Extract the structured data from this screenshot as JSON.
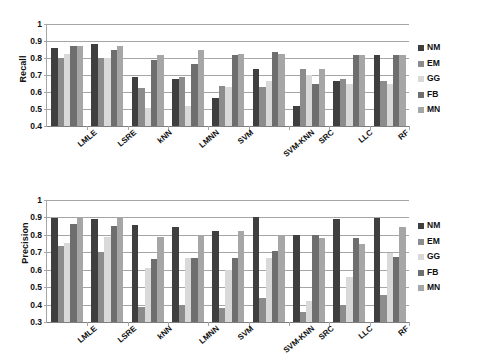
{
  "chart_data": [
    {
      "type": "bar",
      "title": "",
      "xlabel": "",
      "ylabel": "Recall",
      "ylim": [
        0.4,
        1.0
      ],
      "yticks": [
        "0.4",
        "0.5",
        "0.6",
        "0.7",
        "0.8",
        "0.9",
        "1"
      ],
      "grid": true,
      "legend_position": "right",
      "categories": [
        "LMLE",
        "LSRE",
        "kNN",
        "LMNN",
        "SVM",
        "SVM-KNN",
        "SRC",
        "LLC",
        "RF"
      ],
      "series": [
        {
          "name": "NM",
          "color": "#3f3f3f",
          "values": [
            0.86,
            0.885,
            0.69,
            0.675,
            0.565,
            0.735,
            0.515,
            0.665,
            0.815
          ]
        },
        {
          "name": "EM",
          "color": "#8c8c8c",
          "values": [
            0.8,
            0.8,
            0.625,
            0.69,
            0.635,
            0.63,
            0.735,
            0.675,
            0.665
          ]
        },
        {
          "name": "GG",
          "color": "#d9d9d9",
          "values": [
            0.825,
            0.8,
            0.505,
            0.515,
            0.63,
            0.665,
            0.7,
            0.645,
            0.645
          ]
        },
        {
          "name": "FB",
          "color": "#6e6e6e",
          "values": [
            0.87,
            0.85,
            0.79,
            0.765,
            0.82,
            0.835,
            0.645,
            0.82,
            0.82
          ]
        },
        {
          "name": "MN",
          "color": "#a6a6a6",
          "values": [
            0.87,
            0.87,
            0.815,
            0.85,
            0.825,
            0.825,
            0.735,
            0.82,
            0.82
          ]
        }
      ]
    },
    {
      "type": "bar",
      "title": "",
      "xlabel": "",
      "ylabel": "Precision",
      "ylim": [
        0.3,
        1.0
      ],
      "yticks": [
        "0.3",
        "0.4",
        "0.5",
        "0.6",
        "0.7",
        "0.8",
        "0.9",
        "1"
      ],
      "grid": true,
      "legend_position": "right",
      "categories": [
        "LMLE",
        "LSRE",
        "kNN",
        "LMNN",
        "SVM",
        "SVM-KNN",
        "SRC",
        "LLC",
        "RF"
      ],
      "series": [
        {
          "name": "NM",
          "color": "#3f3f3f",
          "values": [
            0.895,
            0.89,
            0.855,
            0.845,
            0.82,
            0.9,
            0.8,
            0.89,
            0.895
          ]
        },
        {
          "name": "EM",
          "color": "#8c8c8c",
          "values": [
            0.735,
            0.7,
            0.385,
            0.395,
            0.38,
            0.44,
            0.355,
            0.4,
            0.455
          ]
        },
        {
          "name": "GG",
          "color": "#d9d9d9",
          "values": [
            0.755,
            0.785,
            0.61,
            0.665,
            0.6,
            0.665,
            0.42,
            0.56,
            0.695
          ]
        },
        {
          "name": "FB",
          "color": "#6e6e6e",
          "values": [
            0.865,
            0.85,
            0.66,
            0.665,
            0.67,
            0.71,
            0.8,
            0.78,
            0.675
          ]
        },
        {
          "name": "MN",
          "color": "#a6a6a6",
          "values": [
            0.9,
            0.895,
            0.785,
            0.8,
            0.825,
            0.8,
            0.78,
            0.75,
            0.845
          ]
        }
      ]
    }
  ],
  "legend": {
    "items": [
      {
        "label": "NM",
        "color": "#3f3f3f"
      },
      {
        "label": "EM",
        "color": "#8c8c8c"
      },
      {
        "label": "GG",
        "color": "#d9d9d9"
      },
      {
        "label": "FB",
        "color": "#6e6e6e"
      },
      {
        "label": "MN",
        "color": "#a6a6a6"
      }
    ]
  }
}
